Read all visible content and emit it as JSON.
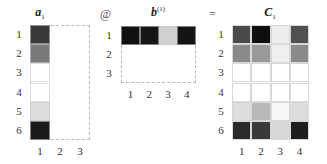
{
  "matrix_a": {
    "title": "a",
    "title_sub": "1",
    "row_labels": [
      "1",
      "2",
      "3",
      "4",
      "5",
      "6"
    ],
    "col_labels": [
      "1",
      "2",
      "3"
    ],
    "cells": [
      "#3a3a3a",
      "#7a7a7a",
      "#ffffff",
      "#ffffff",
      "#dcdcdc",
      "#1a1a1a"
    ]
  },
  "operator_matmul": "@",
  "matrix_b": {
    "title": "b",
    "title_sup": "(1)",
    "row_labels": [
      "1",
      "2",
      "3"
    ],
    "col_labels": [
      "1",
      "2",
      "3",
      "4"
    ],
    "cells": [
      "#111111",
      "#161616",
      "#d0d0d0",
      "#141414"
    ]
  },
  "operator_equals": "=",
  "matrix_c": {
    "title": "C",
    "title_sub": "1",
    "row_labels": [
      "1",
      "2",
      "3",
      "4",
      "5",
      "6"
    ],
    "col_labels": [
      "1",
      "2",
      "3",
      "4"
    ],
    "cells": [
      [
        "#4a4a4a",
        "#0e0e0e",
        "#eeeeee",
        "#505050"
      ],
      [
        "#8a8a8a",
        "#999999",
        "#efefef",
        "#8a8a8a"
      ],
      [
        "#ffffff",
        "#ffffff",
        "#ffffff",
        "#ffffff"
      ],
      [
        "#ffffff",
        "#ffffff",
        "#ffffff",
        "#ffffff"
      ],
      [
        "#dddddd",
        "#b8b8b8",
        "#f7f7f7",
        "#dddddd"
      ],
      [
        "#2a2a2a",
        "#3a3a3a",
        "#d8d8d8",
        "#1c1c1c"
      ]
    ]
  }
}
